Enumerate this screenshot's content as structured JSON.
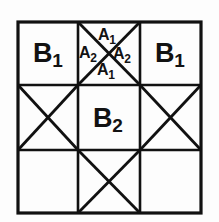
{
  "figure": {
    "name": "three-by-three-grid-diagram",
    "background_color": "#fdfdfd",
    "line_color": "#111111",
    "grid": {
      "rows": 3,
      "cols": 3,
      "left": 18,
      "top": 22,
      "right": 201,
      "bottom": 213,
      "v_divider_x": [
        78,
        140
      ],
      "h_divider_y": [
        85,
        150
      ],
      "outer_stroke_width": 3.2,
      "inner_stroke_width": 2.6,
      "diagonal_stroke_width": 2.8
    },
    "cells": [
      {
        "id": "cell-r1c1",
        "row": 1,
        "col": 1,
        "has_x": false,
        "label": "B",
        "sub": "1"
      },
      {
        "id": "cell-r1c2",
        "row": 1,
        "col": 2,
        "has_x": true,
        "label": "",
        "sub": ""
      },
      {
        "id": "cell-r1c3",
        "row": 1,
        "col": 3,
        "has_x": false,
        "label": "B",
        "sub": "1"
      },
      {
        "id": "cell-r2c1",
        "row": 2,
        "col": 1,
        "has_x": true,
        "label": "",
        "sub": ""
      },
      {
        "id": "cell-r2c2",
        "row": 2,
        "col": 2,
        "has_x": false,
        "label": "B",
        "sub": "2"
      },
      {
        "id": "cell-r2c3",
        "row": 2,
        "col": 3,
        "has_x": true,
        "label": "",
        "sub": ""
      },
      {
        "id": "cell-r3c1",
        "row": 3,
        "col": 1,
        "has_x": false,
        "label": "",
        "sub": ""
      },
      {
        "id": "cell-r3c2",
        "row": 3,
        "col": 2,
        "has_x": true,
        "label": "",
        "sub": ""
      },
      {
        "id": "cell-r3c3",
        "row": 3,
        "col": 3,
        "has_x": false,
        "label": "",
        "sub": ""
      }
    ],
    "labels": {
      "b1_left": {
        "base": "B",
        "sub": "1",
        "text": "B1"
      },
      "b1_right": {
        "base": "B",
        "sub": "1",
        "text": "B1"
      },
      "b2_center": {
        "base": "B",
        "sub": "2",
        "text": "B2"
      },
      "a1_top": {
        "base": "A",
        "sub": "1",
        "text": "A1"
      },
      "a2_left": {
        "base": "A",
        "sub": "2",
        "text": "A2"
      },
      "a2_right": {
        "base": "A",
        "sub": "2",
        "text": "A2"
      },
      "a1_bottom": {
        "base": "A",
        "sub": "1",
        "text": "A1"
      }
    }
  }
}
